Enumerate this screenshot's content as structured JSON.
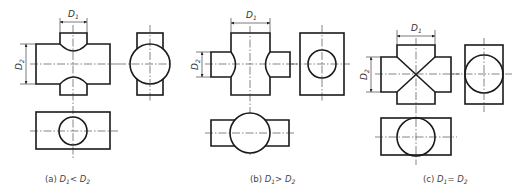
{
  "figures": [
    {
      "id": "a",
      "caption_prefix": "(a)",
      "caption_relation": "<",
      "dim_top": "D",
      "dim_top_sub": "1",
      "dim_side": "D",
      "dim_side_sub": "2"
    },
    {
      "id": "b",
      "caption_prefix": "(b)",
      "caption_relation": ">",
      "dim_top": "D",
      "dim_top_sub": "1",
      "dim_side": "D",
      "dim_side_sub": "2"
    },
    {
      "id": "c",
      "caption_prefix": "(c)",
      "caption_relation": "=",
      "dim_top": "D",
      "dim_top_sub": "1",
      "dim_side": "D",
      "dim_side_sub": "2"
    }
  ],
  "caption_var_1": "D",
  "caption_sub_1": "1",
  "caption_var_2": "D",
  "caption_sub_2": "2",
  "colors": {
    "line": "#1a1a1a",
    "text": "#444444"
  }
}
